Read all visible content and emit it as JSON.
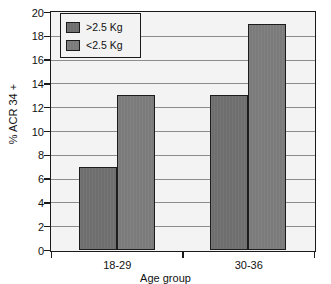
{
  "chart_data": {
    "type": "bar",
    "title": "",
    "xlabel": "Age group",
    "ylabel": "% ACR 34 +",
    "categories": [
      "18-29",
      "30-36"
    ],
    "series": [
      {
        "name": ">2.5 Kg",
        "values": [
          7,
          13
        ],
        "color": "#6e6e6e"
      },
      {
        "name": "<2.5 Kg",
        "values": [
          13,
          19
        ],
        "color": "#7b7b7b"
      }
    ],
    "ylim": [
      0,
      20
    ],
    "ytick_step": 2,
    "yticks": [
      0,
      2,
      4,
      6,
      8,
      10,
      12,
      14,
      16,
      18,
      20
    ],
    "ytick_labels": [
      "0",
      "2",
      "4",
      "6",
      "8",
      "10",
      "12",
      "14",
      "16",
      "18",
      "20"
    ],
    "grid": true,
    "grid_axis": "y",
    "legend_position": "upper left",
    "plot_background": "#f3f3f3",
    "frame_color": "#1a1a1a",
    "gridline_color": "#8c8c8c"
  }
}
